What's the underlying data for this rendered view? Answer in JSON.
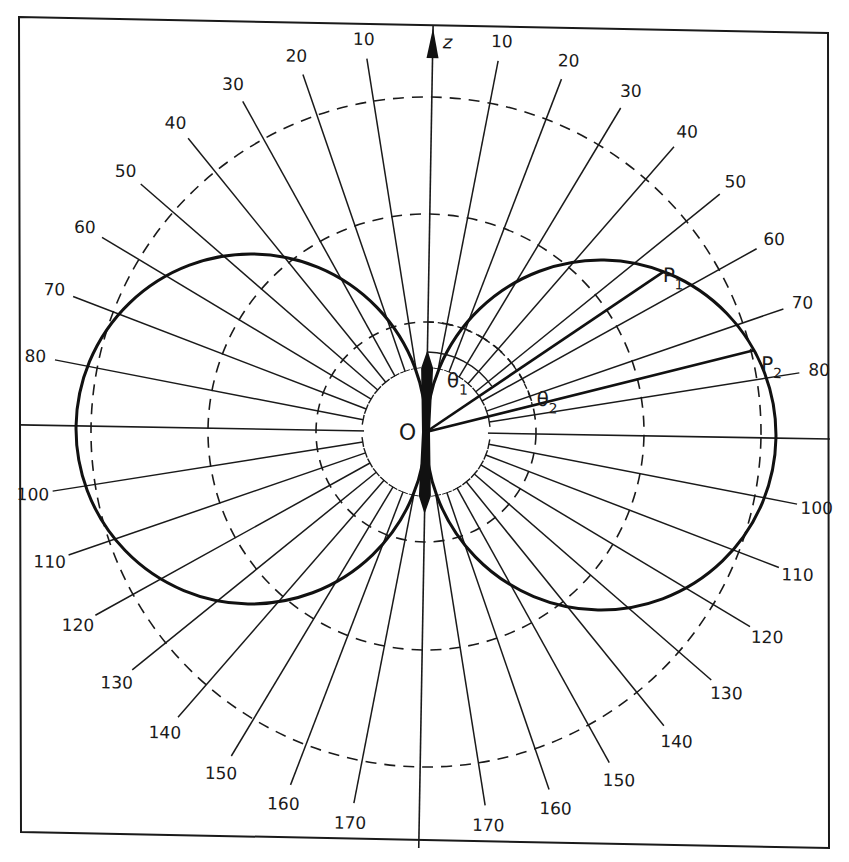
{
  "figure": {
    "type": "polar-radiation-pattern",
    "axis_label": "z",
    "origin_label": "O",
    "points": [
      {
        "label": "P",
        "subscript": "1",
        "angle_deg": 55
      },
      {
        "label": "P",
        "subscript": "2",
        "angle_deg": 75
      }
    ],
    "angles": [
      {
        "label": "θ",
        "subscript": "1"
      },
      {
        "label": "θ",
        "subscript": "2"
      }
    ],
    "angle_ticks_deg": [
      10,
      20,
      30,
      40,
      50,
      60,
      70,
      80,
      100,
      110,
      120,
      130,
      140,
      150,
      160,
      170
    ],
    "right_side_labels": [
      "10",
      "20",
      "30",
      "40",
      "50",
      "60",
      "70",
      "80",
      "100",
      "110",
      "120",
      "130",
      "140",
      "150",
      "160",
      "170"
    ],
    "left_side_labels": [
      "10",
      "20",
      "30",
      "40",
      "50",
      "60",
      "70",
      "80",
      "100",
      "110",
      "120",
      "130",
      "140",
      "150",
      "160",
      "170"
    ],
    "dashed_circles_count": 3,
    "lobes": "two circular lobes tangent at origin (sin θ pattern)",
    "colors": {
      "ink": "#1a1a1a",
      "paper": "#ffffff"
    }
  }
}
